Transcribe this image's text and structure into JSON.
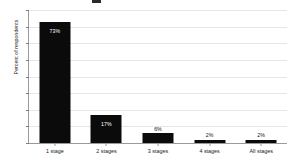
{
  "chart_data": {
    "type": "bar",
    "title": "",
    "xlabel": "",
    "ylabel": "Percent of respondents",
    "categories": [
      "1 stage",
      "2 stages",
      "3 stages",
      "4 stages",
      "All stages"
    ],
    "values": [
      73,
      17,
      6,
      2,
      2
    ],
    "value_labels": [
      "73%",
      "17%",
      "6%",
      "2%",
      "2%"
    ],
    "ylim": [
      0,
      80
    ],
    "ytick_values": [
      80,
      70,
      60,
      50,
      40,
      30,
      20,
      10,
      0
    ],
    "ytick_labels": [
      "80%",
      "70%",
      "60%",
      "50%",
      "40%",
      "30%",
      "20%",
      "10%",
      "0%"
    ],
    "grid": true,
    "legend": "none",
    "bar_color": "#0b0b0b",
    "grid_color": "#e3e6ea",
    "axis_color": "#9a9a9a",
    "background_color": "#ffffff",
    "label_inside_color": "#ffffff",
    "label_outside_color": "#111111"
  }
}
